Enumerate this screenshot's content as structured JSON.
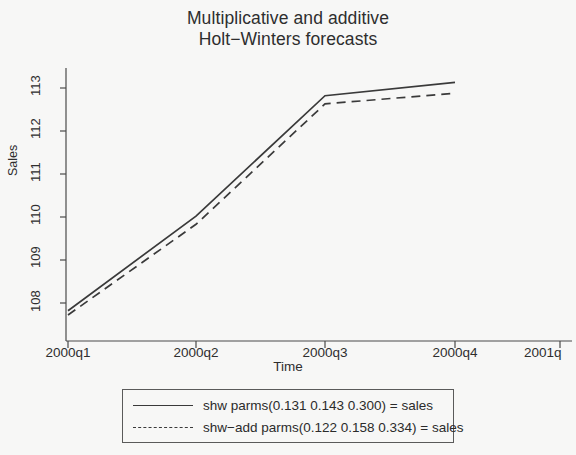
{
  "chart_data": {
    "type": "line",
    "title": "Multiplicative and additive Holt−Winters forecasts",
    "title_line1": "Multiplicative and additive",
    "title_line2": "Holt−Winters forecasts",
    "xlabel": "Time",
    "ylabel": "Sales",
    "grid": false,
    "legend_position": "below-plot",
    "x": [
      "2000q1",
      "2000q2",
      "2000q3",
      "2000q4"
    ],
    "xticks": [
      "2000q1",
      "2000q2",
      "2000q3",
      "2000q4",
      "2001q"
    ],
    "yticks": [
      "108",
      "109",
      "110",
      "111",
      "112",
      "113"
    ],
    "ylim": [
      107.6,
      113.35
    ],
    "xlim": [
      2000.0,
      2001.0
    ],
    "series": [
      {
        "name": "shw parms(0.131 0.143 0.300) = sales",
        "style": "solid",
        "color": "#3a3a3a",
        "values": [
          107.82,
          110.02,
          112.82,
          113.13
        ]
      },
      {
        "name": "shw-add parms(0.122 0.158 0.334) = sales",
        "style": "dashed",
        "color": "#3a3a3a",
        "values": [
          107.72,
          109.83,
          112.63,
          112.88
        ]
      }
    ],
    "legend": [
      {
        "label": "shw parms(0.131 0.143 0.300) = sales",
        "style": "solid"
      },
      {
        "label": "shw−add parms(0.122 0.158 0.334) = sales",
        "style": "dashed"
      }
    ],
    "colors": {
      "background": "#f7f7f6",
      "axis": "#4a4a4a",
      "line": "#3a3a3a",
      "text": "#2b2b2b"
    }
  }
}
